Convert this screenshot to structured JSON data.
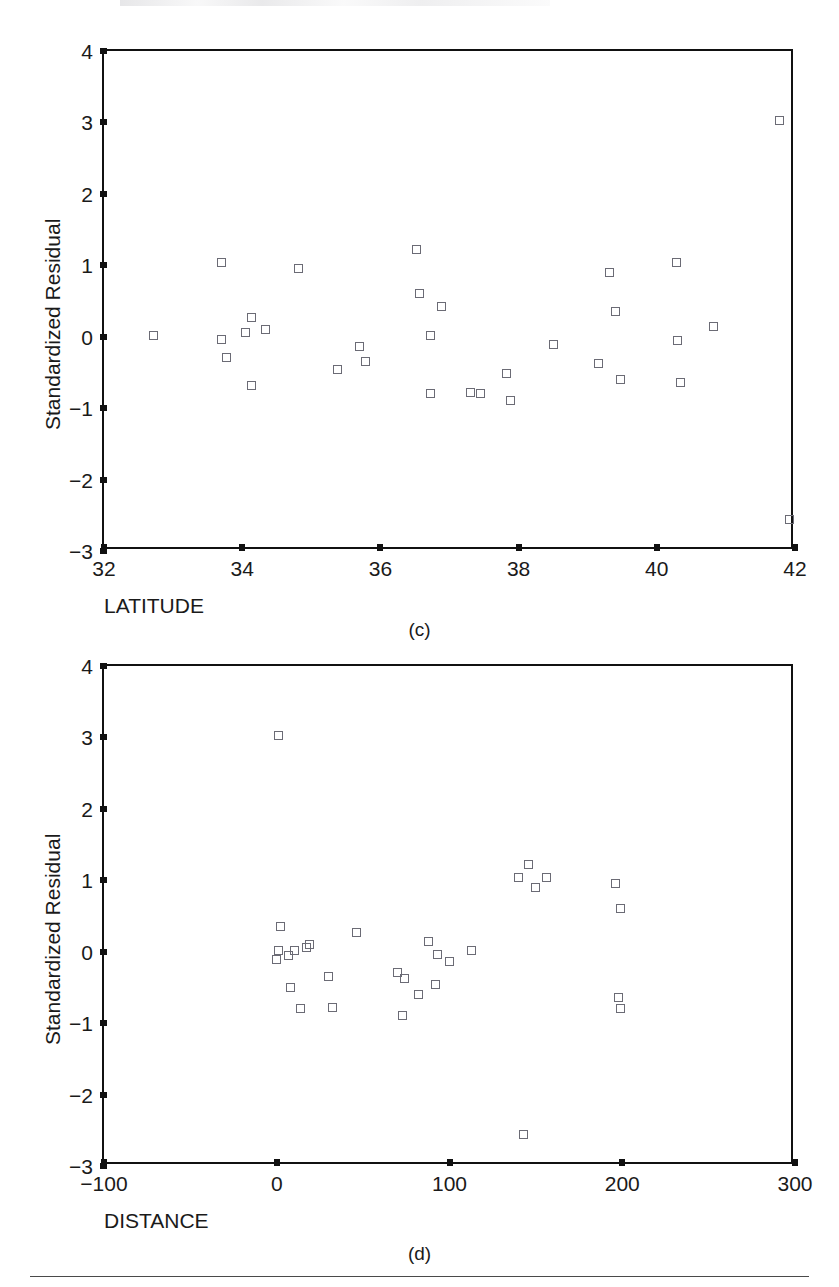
{
  "figure": {
    "background_color": "#ffffff",
    "marker_color": "#6b6b75",
    "axis_color": "#111111",
    "rule_color": "#4a4a4a"
  },
  "panels": [
    {
      "id": "c",
      "caption": "(c)",
      "xlabel": "LATITUDE",
      "ylabel": "Standardized Residual"
    },
    {
      "id": "d",
      "caption": "(d)",
      "xlabel": "DISTANCE",
      "ylabel": "Standardized Residual"
    }
  ],
  "chart_data": [
    {
      "type": "scatter",
      "panel": "c",
      "title": "",
      "xlabel": "LATITUDE",
      "ylabel": "Standardized Residual",
      "xlim": [
        32,
        42
      ],
      "ylim": [
        -3,
        4
      ],
      "xticks": [
        32,
        34,
        36,
        38,
        40,
        42
      ],
      "xticklabels": [
        "32",
        "34",
        "36",
        "38",
        "40",
        "42"
      ],
      "yticks": [
        -3,
        -2,
        -1,
        0,
        1,
        2,
        3,
        4
      ],
      "yticklabels": [
        "−3",
        "−2",
        "−1",
        "0",
        "1",
        "2",
        "3",
        "4"
      ],
      "grid": false,
      "legend": false,
      "marker": "open-square",
      "points": [
        {
          "x": 32.72,
          "y": 0.02
        },
        {
          "x": 33.7,
          "y": 1.04
        },
        {
          "x": 33.7,
          "y": -0.04
        },
        {
          "x": 33.78,
          "y": -0.29
        },
        {
          "x": 34.05,
          "y": 0.06
        },
        {
          "x": 34.13,
          "y": 0.27
        },
        {
          "x": 34.13,
          "y": -0.68
        },
        {
          "x": 34.33,
          "y": 0.1
        },
        {
          "x": 34.82,
          "y": 0.96
        },
        {
          "x": 35.38,
          "y": -0.46
        },
        {
          "x": 35.7,
          "y": -0.14
        },
        {
          "x": 35.78,
          "y": -0.34
        },
        {
          "x": 36.52,
          "y": 1.22
        },
        {
          "x": 36.57,
          "y": 0.6
        },
        {
          "x": 36.72,
          "y": 0.02
        },
        {
          "x": 36.72,
          "y": -0.8
        },
        {
          "x": 36.88,
          "y": 0.42
        },
        {
          "x": 37.3,
          "y": -0.78
        },
        {
          "x": 37.45,
          "y": -0.79
        },
        {
          "x": 37.82,
          "y": -0.52
        },
        {
          "x": 37.88,
          "y": -0.89
        },
        {
          "x": 38.5,
          "y": -0.11
        },
        {
          "x": 39.15,
          "y": -0.38
        },
        {
          "x": 39.32,
          "y": 0.9
        },
        {
          "x": 39.4,
          "y": 0.35
        },
        {
          "x": 39.48,
          "y": -0.6
        },
        {
          "x": 40.28,
          "y": 1.04
        },
        {
          "x": 40.3,
          "y": -0.05
        },
        {
          "x": 40.35,
          "y": -0.64
        },
        {
          "x": 40.82,
          "y": 0.14
        },
        {
          "x": 41.78,
          "y": 3.03
        },
        {
          "x": 41.92,
          "y": -2.56
        }
      ]
    },
    {
      "type": "scatter",
      "panel": "d",
      "title": "",
      "xlabel": "DISTANCE",
      "ylabel": "Standardized Residual",
      "xlim": [
        -100,
        300
      ],
      "ylim": [
        -3,
        4
      ],
      "xticks": [
        -100,
        0,
        100,
        200,
        300
      ],
      "xticklabels": [
        "−100",
        "0",
        "100",
        "200",
        "300"
      ],
      "yticks": [
        -3,
        -2,
        -1,
        0,
        1,
        2,
        3,
        4
      ],
      "yticklabels": [
        "−3",
        "−2",
        "−1",
        "0",
        "1",
        "2",
        "3",
        "4"
      ],
      "grid": false,
      "legend": false,
      "marker": "open-square",
      "points": [
        {
          "x": 1,
          "y": 3.03
        },
        {
          "x": 2,
          "y": 0.35
        },
        {
          "x": 1,
          "y": 0.02
        },
        {
          "x": 0,
          "y": -0.11
        },
        {
          "x": 7,
          "y": -0.05
        },
        {
          "x": 10,
          "y": 0.02
        },
        {
          "x": 8,
          "y": -0.5
        },
        {
          "x": 14,
          "y": -0.8
        },
        {
          "x": 17,
          "y": 0.06
        },
        {
          "x": 19,
          "y": 0.1
        },
        {
          "x": 30,
          "y": -0.34
        },
        {
          "x": 32,
          "y": -0.78
        },
        {
          "x": 46,
          "y": 0.27
        },
        {
          "x": 70,
          "y": -0.29
        },
        {
          "x": 74,
          "y": -0.38
        },
        {
          "x": 73,
          "y": -0.89
        },
        {
          "x": 82,
          "y": -0.6
        },
        {
          "x": 88,
          "y": 0.14
        },
        {
          "x": 92,
          "y": -0.46
        },
        {
          "x": 93,
          "y": -0.04
        },
        {
          "x": 100,
          "y": -0.14
        },
        {
          "x": 113,
          "y": 0.02
        },
        {
          "x": 140,
          "y": 1.04
        },
        {
          "x": 146,
          "y": 1.22
        },
        {
          "x": 150,
          "y": 0.9
        },
        {
          "x": 156,
          "y": 1.04
        },
        {
          "x": 143,
          "y": -2.56
        },
        {
          "x": 196,
          "y": 0.96
        },
        {
          "x": 199,
          "y": 0.6
        },
        {
          "x": 198,
          "y": -0.64
        },
        {
          "x": 199,
          "y": -0.8
        }
      ]
    }
  ]
}
